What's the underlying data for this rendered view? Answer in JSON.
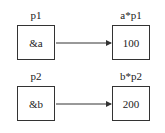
{
  "rows": [
    {
      "pointer": {
        "name": "p1",
        "value": "&a"
      },
      "target": {
        "name": "a*p1",
        "value": "100"
      }
    },
    {
      "pointer": {
        "name": "p2",
        "value": "&b"
      },
      "target": {
        "name": "b*p2",
        "value": "200"
      }
    }
  ],
  "colors": {
    "line": "#333333",
    "background": "#ffffff"
  }
}
